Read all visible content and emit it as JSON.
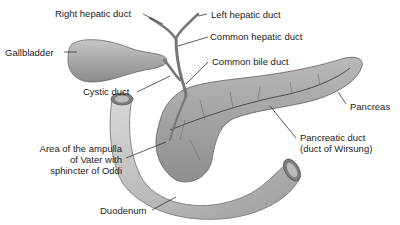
{
  "diagram": {
    "labels": {
      "right_hepatic_duct": "Right hepatic duct",
      "left_hepatic_duct": "Left hepatic duct",
      "gallbladder": "Gallbladder",
      "common_hepatic_duct": "Common hepatic duct",
      "common_bile_duct": "Common bile duct",
      "cystic_duct": "Cystic duct",
      "pancreas": "Pancreas",
      "ampulla_line1": "Area of the ampulla",
      "ampulla_line2": "of Vater with",
      "ampulla_line3": "sphincter of Oddi",
      "pancreatic_duct_line1": "Pancreatic duct",
      "pancreatic_duct_line2": "(duct of Wirsung)",
      "duodenum": "Duodenum"
    },
    "colors": {
      "organ_fill": "#a9a9a9",
      "organ_shadow": "#7a7a7a",
      "duodenum_fill": "#bdbdbd",
      "duct_fill": "#9a9a9a",
      "leader_line": "#333333",
      "text": "#222222"
    }
  }
}
